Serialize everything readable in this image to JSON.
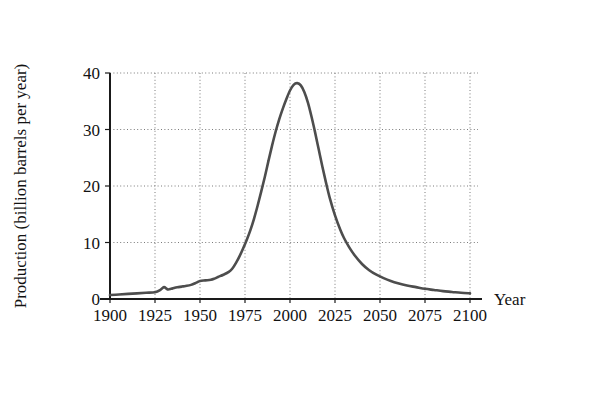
{
  "figure": {
    "name": "peak-oil-production-curve",
    "background_color": "#ffffff"
  },
  "chart_data": {
    "type": "line",
    "title": "",
    "xlabel": "Year",
    "ylabel": "Production (billion barrels per year)",
    "xlim": [
      1900,
      2100
    ],
    "ylim": [
      0,
      40
    ],
    "xticks": [
      "1900",
      "1925",
      "1950",
      "1975",
      "2000",
      "2025",
      "2050",
      "2075",
      "2100"
    ],
    "xtick_values": [
      1900,
      1925,
      1950,
      1975,
      2000,
      2025,
      2050,
      2075,
      2100
    ],
    "yticks": [
      "0",
      "10",
      "20",
      "30",
      "40"
    ],
    "ytick_values": [
      0,
      10,
      20,
      30,
      40
    ],
    "grid": true,
    "grid_style": "dotted",
    "grid_color": "#7a7a7a",
    "legend": null,
    "line_color": "#4d4d4d",
    "line_width": 2.6,
    "peak": {
      "x": 2000,
      "y": 38.2,
      "label": ""
    },
    "x": [
      1900,
      1905,
      1910,
      1915,
      1920,
      1925,
      1928,
      1930,
      1932,
      1934,
      1936,
      1938,
      1940,
      1942,
      1945,
      1948,
      1950,
      1953,
      1956,
      1958,
      1960,
      1963,
      1966,
      1968,
      1970,
      1972,
      1974,
      1976,
      1978,
      1980,
      1982,
      1984,
      1986,
      1988,
      1990,
      1992,
      1994,
      1996,
      1998,
      2000,
      2002,
      2004,
      2006,
      2008,
      2010,
      2012,
      2014,
      2016,
      2018,
      2020,
      2022,
      2025,
      2028,
      2030,
      2033,
      2036,
      2040,
      2044,
      2048,
      2052,
      2056,
      2060,
      2065,
      2070,
      2075,
      2080,
      2085,
      2090,
      2095,
      2100
    ],
    "y": [
      0.7,
      0.8,
      0.9,
      1.0,
      1.1,
      1.2,
      1.6,
      2.1,
      1.7,
      1.8,
      2.0,
      2.1,
      2.2,
      2.3,
      2.5,
      2.9,
      3.2,
      3.3,
      3.4,
      3.6,
      3.9,
      4.3,
      4.8,
      5.4,
      6.4,
      7.6,
      9.0,
      10.5,
      12.2,
      14.2,
      16.5,
      19.0,
      21.6,
      24.4,
      27.1,
      29.6,
      31.8,
      33.7,
      35.4,
      36.9,
      37.9,
      38.2,
      37.8,
      36.6,
      34.7,
      32.2,
      29.4,
      26.4,
      23.4,
      20.6,
      18.0,
      14.8,
      12.2,
      10.8,
      9.1,
      7.7,
      6.2,
      5.1,
      4.3,
      3.7,
      3.2,
      2.8,
      2.4,
      2.1,
      1.8,
      1.6,
      1.4,
      1.25,
      1.1,
      1.0
    ]
  }
}
